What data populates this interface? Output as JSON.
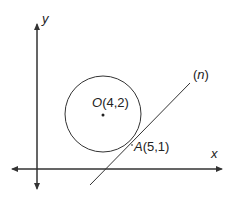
{
  "diagram": {
    "axes": {
      "x_label": "x",
      "y_label": "y"
    },
    "circle": {
      "center_label_letter": "O",
      "center_label_coords": "(4,2)",
      "center": [
        4,
        2
      ]
    },
    "tangent_point": {
      "label_letter": "A",
      "label_coords": "(5,1)",
      "point": [
        5,
        1
      ]
    },
    "line": {
      "label_open": "(",
      "label_name": "n",
      "label_close": ")"
    },
    "colors": {
      "stroke": "#333333",
      "text": "#222222",
      "background": "#ffffff"
    }
  }
}
